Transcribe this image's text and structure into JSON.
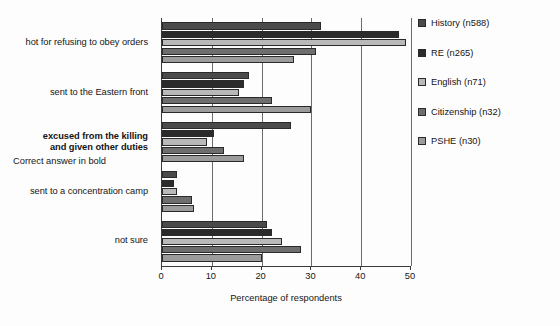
{
  "chart_data": {
    "type": "bar",
    "orientation": "horizontal",
    "title": "",
    "xlabel": "Percentage of respondents",
    "ylabel": "",
    "xlim": [
      0,
      50
    ],
    "xticks": [
      0,
      10,
      20,
      30,
      40,
      50
    ],
    "grid": true,
    "legend_position": "right",
    "categories": [
      "hot for refusing to obey orders",
      "sent to the Eastern front",
      "excused from the killing and given other duties",
      "sent to a concentration camp",
      "not sure"
    ],
    "category_lines": [
      [
        "hot for refusing to obey orders"
      ],
      [
        "sent to the Eastern front"
      ],
      [
        "excused from the killing",
        "and given other duties"
      ],
      [
        "sent to a concentration camp"
      ],
      [
        "not sure"
      ]
    ],
    "category_bold": [
      false,
      false,
      true,
      false,
      false
    ],
    "series": [
      {
        "name": "History (n588)",
        "color": "#4a4a4a",
        "values": [
          32.0,
          17.5,
          26.0,
          3.0,
          21.0
        ]
      },
      {
        "name": "RE (n265)",
        "color": "#2b2b2b",
        "values": [
          47.5,
          16.5,
          10.5,
          2.5,
          22.0
        ]
      },
      {
        "name": "English (n71)",
        "color": "#b9b9b9",
        "values": [
          49.0,
          15.5,
          9.0,
          3.0,
          24.0
        ]
      },
      {
        "name": "Citizenship (n32)",
        "color": "#6e6e6e",
        "values": [
          31.0,
          22.0,
          12.5,
          6.0,
          28.0
        ]
      },
      {
        "name": "PSHE (n30)",
        "color": "#9b9b9b",
        "values": [
          26.5,
          30.0,
          16.5,
          6.5,
          20.0
        ]
      }
    ],
    "annotation": "Correct answer in bold"
  },
  "legend": {
    "entries": [
      {
        "label": "History (n588)"
      },
      {
        "label": "RE (n265)"
      },
      {
        "label": "English (n71)"
      },
      {
        "label": "Citizenship (n32)"
      },
      {
        "label": "PSHE (n30)"
      }
    ],
    "note": "Correct answer in bold"
  },
  "axis": {
    "x_title": "Percentage of respondents",
    "x_tick_labels": [
      "0",
      "10",
      "20",
      "30",
      "40",
      "50"
    ]
  }
}
